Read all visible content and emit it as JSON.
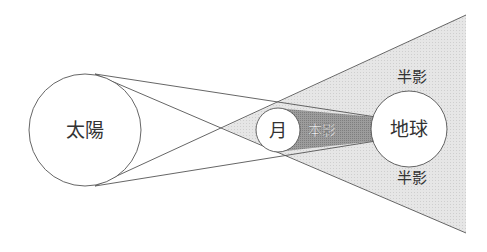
{
  "diagram": {
    "title": "",
    "bodies": {
      "sun": {
        "label": "太陽"
      },
      "moon": {
        "label": "月"
      },
      "earth": {
        "label": "地球"
      }
    },
    "regions": {
      "umbra": {
        "label": "本影"
      },
      "penumbra_top": {
        "label": "半影"
      },
      "penumbra_bottom": {
        "label": "半影"
      }
    },
    "colors": {
      "penumbra_fill": "#e4e4e4",
      "umbra_fill": "#9a9a9a",
      "stroke": "#555555",
      "text": "#333333",
      "umbra_text": "#ffffff"
    }
  }
}
